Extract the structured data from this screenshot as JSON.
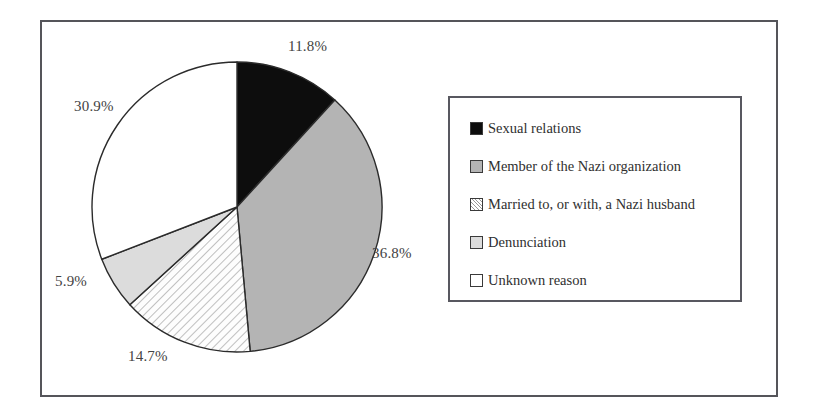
{
  "figure": {
    "title": "",
    "pie": {
      "center_x": 237,
      "center_y": 207,
      "radius": 145,
      "start_angle_deg": 0
    }
  },
  "chart_data": {
    "type": "pie",
    "title": "",
    "xlabel": "",
    "ylabel": "",
    "legend_position": "right",
    "grid": false,
    "categories": [
      "Sexual relations",
      "Member of the Nazi organization",
      "Married to, or with, a Nazi husband",
      "Denunciation",
      "Unknown reason"
    ],
    "values": [
      11.8,
      36.8,
      14.7,
      5.9,
      30.9
    ],
    "value_labels": [
      "11.8%",
      "36.8%",
      "14.7%",
      "5.9%",
      "30.9%"
    ],
    "fills": [
      "solid-black",
      "solid-gray",
      "diagonal-hatch",
      "solid-light-gray",
      "solid-white"
    ],
    "colors": [
      "#0d0d0d",
      "#b4b4b4",
      "#fdfdfd",
      "#dcdcdc",
      "#ffffff"
    ],
    "outline_color": "#2b2b2b"
  },
  "labels": [
    {
      "text": "11.8%",
      "x": 288,
      "y": 38
    },
    {
      "text": "36.8%",
      "x": 372,
      "y": 245
    },
    {
      "text": "14.7%",
      "x": 128,
      "y": 348
    },
    {
      "text": "5.9%",
      "x": 55,
      "y": 273
    },
    {
      "text": "30.9%",
      "x": 74,
      "y": 98
    }
  ],
  "legend": {
    "items": [
      {
        "label": "Sexual relations",
        "swatch": "sw-black",
        "swatch_name": "legend-swatch-sexual-relations"
      },
      {
        "label": "Member of the Nazi organization",
        "swatch": "sw-gray",
        "swatch_name": "legend-swatch-nazi-member"
      },
      {
        "label": "Married to, or with, a Nazi husband",
        "swatch": "sw-hatch",
        "swatch_name": "legend-swatch-nazi-husband"
      },
      {
        "label": "Denunciation",
        "swatch": "sw-ltgray",
        "swatch_name": "legend-swatch-denunciation"
      },
      {
        "label": "Unknown reason",
        "swatch": "sw-white",
        "swatch_name": "legend-swatch-unknown-reason"
      }
    ]
  }
}
